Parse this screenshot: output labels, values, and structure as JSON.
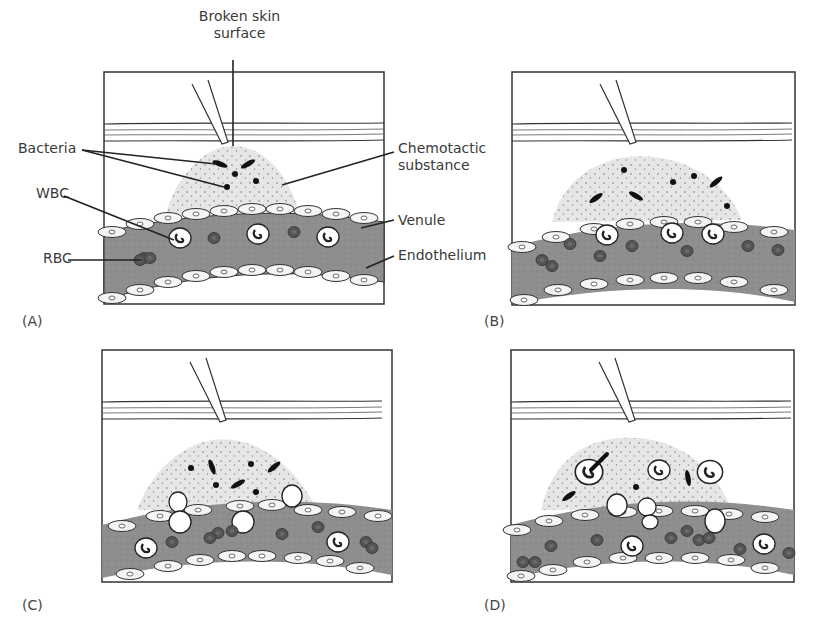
{
  "figure": {
    "panels": [
      {
        "id": "A",
        "label": "(A)",
        "stage": "Bacteria enter through broken skin; chemotactic substance released"
      },
      {
        "id": "B",
        "label": "(B)",
        "stage": "WBCs move to venule wall (margination)"
      },
      {
        "id": "C",
        "label": "(C)",
        "stage": "WBCs squeeze through endothelium (diapedesis)"
      },
      {
        "id": "D",
        "label": "(D)",
        "stage": "WBCs in tissue engulf bacteria (phagocytosis)"
      }
    ],
    "annotations": {
      "broken_skin_line1": "Broken skin",
      "broken_skin_line2": "surface",
      "bacteria": "Bacteria",
      "wbc": "WBC",
      "rbc": "RBC",
      "chemotactic_line1": "Chemotactic",
      "chemotactic_line2": "substance",
      "venule": "Venule",
      "endothelium": "Endothelium"
    },
    "colors": {
      "venule_fill": "#8c8c8c",
      "exudate_fill": "#e4e4e4",
      "cell_outline": "#333333",
      "rbc_fill": "#555555",
      "border": "#333333"
    }
  }
}
